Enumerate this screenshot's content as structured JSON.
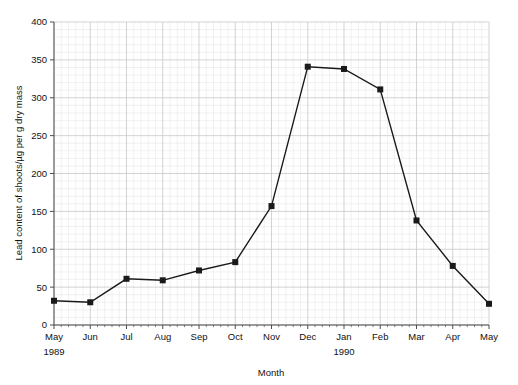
{
  "cropped_header_text": "",
  "chart_data": {
    "type": "line",
    "title": "",
    "xlabel": "Month",
    "ylabel": "Lead content of shoots/µg per g dry mass",
    "categories": [
      "May",
      "Jun",
      "Jul",
      "Aug",
      "Sep",
      "Oct",
      "Nov",
      "Dec",
      "Jan",
      "Feb",
      "Mar",
      "Apr",
      "May"
    ],
    "values": [
      32,
      30,
      61,
      59,
      72,
      83,
      157,
      341,
      338,
      311,
      138,
      78,
      28
    ],
    "series": [
      {
        "name": "Lead content of shoots",
        "values": [
          32,
          30,
          61,
          59,
          72,
          83,
          157,
          341,
          338,
          311,
          138,
          78,
          28
        ]
      }
    ],
    "x_group_labels": [
      {
        "label": "1989",
        "at_category": "May",
        "index": 0
      },
      {
        "label": "1990",
        "at_category": "Jan",
        "index": 8
      }
    ],
    "ylim": [
      0,
      400
    ],
    "ytick_labels": [
      "0",
      "50",
      "100",
      "150",
      "200",
      "250",
      "300",
      "350",
      "400"
    ],
    "yticks": [
      0,
      50,
      100,
      150,
      200,
      250,
      300,
      350,
      400
    ],
    "y_minor_step": 10,
    "xlim_categories": [
      "May",
      "May"
    ],
    "grid": true,
    "grid_minor": true,
    "legend": false,
    "legend_position": "none",
    "marker": "square",
    "line_color": "#1a1a1a",
    "marker_color": "#1a1a1a",
    "grid_major_color": "#c8c8c8",
    "grid_minor_color": "#e8e8e8",
    "axis_color": "#4d4d4d",
    "background_color": "#ffffff"
  }
}
